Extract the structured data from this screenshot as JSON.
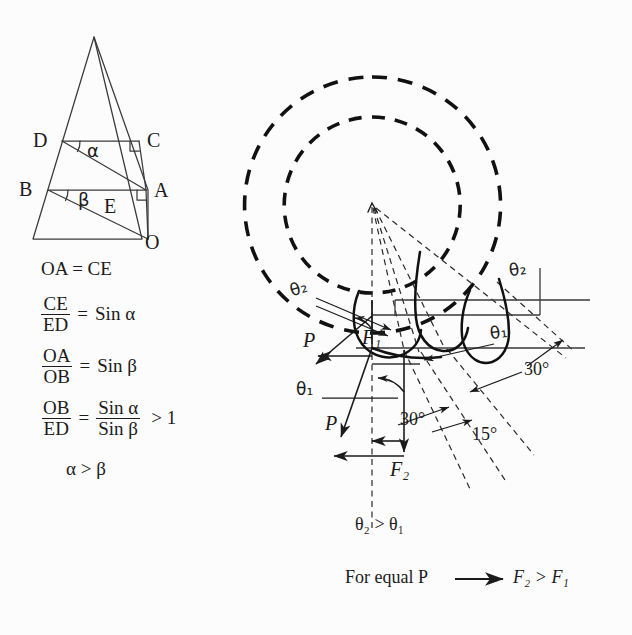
{
  "figure": {
    "background": "#fcfcfc",
    "ink": "#1b1b1b"
  },
  "left_diagram": {
    "name": "sine-ratio-triangle",
    "vertices": [
      {
        "id": "D",
        "label": "D",
        "x": 47,
        "y": 141
      },
      {
        "id": "C",
        "label": "C",
        "x": 141,
        "y": 141
      },
      {
        "id": "B",
        "label": "B",
        "x": 33,
        "y": 190
      },
      {
        "id": "A",
        "label": "A",
        "x": 148,
        "y": 190
      },
      {
        "id": "E",
        "label": "E",
        "x": 110,
        "y": 205
      },
      {
        "id": "O",
        "label": "O",
        "x": 148,
        "y": 239
      }
    ],
    "angles": [
      {
        "id": "alpha",
        "label": "α",
        "x": 93,
        "y": 152
      },
      {
        "id": "beta",
        "label": "β",
        "x": 84,
        "y": 201
      }
    ]
  },
  "equations": [
    {
      "id": "eq1",
      "type": "plain",
      "text": "OA = CE"
    },
    {
      "id": "eq2",
      "type": "fraction",
      "num": "CE",
      "den": "ED",
      "rel": "=",
      "rhs": "Sin α"
    },
    {
      "id": "eq3",
      "type": "fraction",
      "num": "OA",
      "den": "OB",
      "rel": "=",
      "rhs": "Sin β"
    },
    {
      "id": "eq4",
      "type": "fraction-ratio",
      "num": "OB",
      "den": "ED",
      "rel": "=",
      "rnum": "Sin α",
      "rden": "Sin β",
      "tail": "> 1"
    },
    {
      "id": "eq5",
      "type": "plain",
      "text": "α > β"
    }
  ],
  "right_diagram": {
    "name": "cutting-tool-force-diagram",
    "force_labels": [
      {
        "id": "P-upper",
        "label": "P",
        "x": 308,
        "y": 341
      },
      {
        "id": "P-lower",
        "label": "P",
        "x": 330,
        "y": 424
      },
      {
        "id": "F1",
        "label": "F₁",
        "x": 372,
        "y": 339
      },
      {
        "id": "F2",
        "label": "F₂",
        "x": 399,
        "y": 470
      }
    ],
    "angle_labels": [
      {
        "id": "theta2-left",
        "label": "θ₂",
        "x": 298,
        "y": 290
      },
      {
        "id": "theta2-right",
        "label": "θ₂",
        "x": 516,
        "y": 272
      },
      {
        "id": "theta1-left",
        "label": "θ₁",
        "x": 303,
        "y": 392
      },
      {
        "id": "theta1-right",
        "label": "θ₁",
        "x": 497,
        "y": 335
      },
      {
        "id": "deg30-right",
        "label": "30°",
        "x": 530,
        "y": 371
      },
      {
        "id": "deg30-center",
        "label": "30°",
        "x": 406,
        "y": 421
      },
      {
        "id": "deg15",
        "label": "15°",
        "x": 478,
        "y": 436
      }
    ]
  },
  "captions": [
    {
      "id": "caption-theta",
      "text": "θ₂ > θ₁",
      "x": 360,
      "y": 527
    },
    {
      "id": "caption-force-lhs",
      "text": "For equal P",
      "x": 380,
      "y": 580
    },
    {
      "id": "caption-force-rhs",
      "text": "F₂ > F₁",
      "x": 516,
      "y": 578
    }
  ]
}
